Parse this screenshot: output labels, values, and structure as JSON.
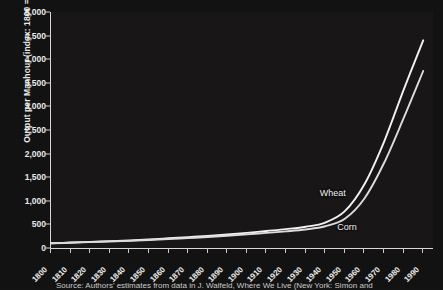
{
  "chart_data": {
    "type": "line",
    "title": "",
    "xlabel": "",
    "ylabel": "Output per Manhour (index: 1800 = 100)",
    "xlim": [
      1800,
      1995
    ],
    "ylim": [
      0,
      5000
    ],
    "grid": false,
    "legend_position": "inline-annotations",
    "xticks": [
      "1800",
      "1810",
      "1820",
      "1830",
      "1840",
      "1850",
      "1860",
      "1870",
      "1880",
      "1890",
      "1900",
      "1910",
      "1920",
      "1930",
      "1940",
      "1950",
      "1960",
      "1970",
      "1980",
      "1990"
    ],
    "yticks": [
      "0",
      "500",
      "1,000",
      "1,500",
      "2,000",
      "2,500",
      "3,000",
      "3,500",
      "4,000",
      "4,500",
      "5,000"
    ],
    "x": [
      1800,
      1810,
      1820,
      1830,
      1840,
      1850,
      1860,
      1870,
      1880,
      1890,
      1900,
      1910,
      1920,
      1930,
      1940,
      1950,
      1960,
      1970,
      1980,
      1990
    ],
    "series": [
      {
        "name": "Wheat",
        "color": "#f2f2f2",
        "values": [
          100,
          115,
          130,
          145,
          160,
          180,
          205,
          230,
          255,
          285,
          320,
          360,
          400,
          450,
          540,
          780,
          1350,
          2250,
          3350,
          4400
        ]
      },
      {
        "name": "Corn",
        "color": "#dcdcdc",
        "values": [
          100,
          112,
          125,
          138,
          152,
          168,
          188,
          210,
          232,
          258,
          288,
          320,
          352,
          392,
          460,
          620,
          1050,
          1800,
          2750,
          3750
        ]
      }
    ],
    "annotations": [
      {
        "text": "Wheat",
        "x": 1953,
        "y": 1150
      },
      {
        "text": "Corn",
        "x": 1962,
        "y": 420
      }
    ]
  },
  "caption": {
    "source_text": "Source: Authors' estimates from data in J. Walfeld, Where We Live (New York: Simon and"
  },
  "colors": {
    "background": "#111010",
    "plot_background": "#161414",
    "axis": "#d8d8d8",
    "text": "#ededed"
  }
}
